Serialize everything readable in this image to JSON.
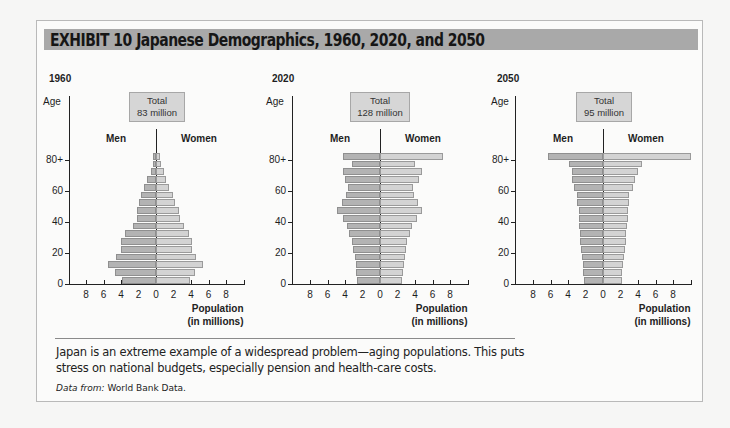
{
  "exhibit": {
    "title": "EXHIBIT 10  Japanese Demographics, 1960, 2020, and 2050",
    "caption": "Japan is an extreme example of a widespread problem—aging populations. This puts stress on national budgets, especially pension and health-care costs.",
    "source_label": "Data from:",
    "source_text": " World Bank Data."
  },
  "colors": {
    "header_bar": "#a9a9a9",
    "men_bar": "#b3b3b3",
    "women_bar": "#d3d3d3",
    "total_box": "#d6d6d6"
  },
  "chart_data": [
    {
      "type": "bar",
      "subtype": "population-pyramid",
      "title": "1960",
      "total_label": [
        "Total",
        "83 million"
      ],
      "ylabel": "Age",
      "xlabel": "Population (in millions)",
      "ytick_labels": [
        "0",
        "20",
        "40",
        "60",
        "80+"
      ],
      "xtick_labels": [
        "8",
        "6",
        "4",
        "2",
        "0",
        "2",
        "4",
        "6",
        "8"
      ],
      "xlim": [
        -10,
        10
      ],
      "legend": [
        "Men",
        "Women"
      ],
      "categories": [
        "0-4",
        "5-9",
        "10-14",
        "15-19",
        "20-24",
        "25-29",
        "30-34",
        "35-39",
        "40-44",
        "45-49",
        "50-54",
        "55-59",
        "60-64",
        "65-69",
        "70-74",
        "75-79",
        "80+"
      ],
      "series": [
        {
          "name": "Men",
          "values": [
            3.9,
            4.7,
            5.5,
            4.6,
            4.0,
            4.0,
            3.6,
            2.6,
            2.2,
            2.2,
            2.0,
            1.7,
            1.4,
            1.0,
            0.6,
            0.4,
            0.3
          ]
        },
        {
          "name": "Women",
          "values": [
            3.9,
            4.5,
            5.4,
            4.6,
            4.1,
            4.1,
            3.8,
            3.2,
            2.7,
            2.6,
            2.2,
            1.9,
            1.5,
            1.1,
            0.9,
            0.6,
            0.5
          ]
        }
      ]
    },
    {
      "type": "bar",
      "subtype": "population-pyramid",
      "title": "2020",
      "total_label": [
        "Total",
        "128 million"
      ],
      "ylabel": "Age",
      "xlabel": "Population (in millions)",
      "ytick_labels": [
        "0",
        "20",
        "40",
        "60",
        "80+"
      ],
      "xtick_labels": [
        "8",
        "6",
        "4",
        "2",
        "0",
        "2",
        "4",
        "6",
        "8"
      ],
      "xlim": [
        -10,
        10
      ],
      "legend": [
        "Men",
        "Women"
      ],
      "categories": [
        "0-4",
        "5-9",
        "10-14",
        "15-19",
        "20-24",
        "25-29",
        "30-34",
        "35-39",
        "40-44",
        "45-49",
        "50-54",
        "55-59",
        "60-64",
        "65-69",
        "70-74",
        "75-79",
        "80+"
      ],
      "series": [
        {
          "name": "Men",
          "values": [
            2.6,
            2.7,
            2.8,
            2.9,
            3.1,
            3.2,
            3.5,
            3.8,
            4.2,
            4.9,
            4.4,
            3.9,
            3.7,
            4.0,
            4.2,
            3.2,
            4.2
          ]
        },
        {
          "name": "Women",
          "values": [
            2.5,
            2.6,
            2.7,
            2.8,
            3.0,
            3.1,
            3.4,
            3.7,
            4.2,
            4.8,
            4.3,
            3.9,
            3.8,
            4.4,
            4.8,
            4.0,
            7.2
          ]
        }
      ]
    },
    {
      "type": "bar",
      "subtype": "population-pyramid",
      "title": "2050",
      "total_label": [
        "Total",
        "95 million"
      ],
      "ylabel": "Age",
      "xlabel": "Population (in millions)",
      "ytick_labels": [
        "0",
        "20",
        "40",
        "60",
        "80+"
      ],
      "xtick_labels": [
        "8",
        "6",
        "4",
        "2",
        "0",
        "2",
        "4",
        "6",
        "8"
      ],
      "xlim": [
        -10,
        10
      ],
      "legend": [
        "Men",
        "Women"
      ],
      "categories": [
        "0-4",
        "5-9",
        "10-14",
        "15-19",
        "20-24",
        "25-29",
        "30-34",
        "35-39",
        "40-44",
        "45-49",
        "50-54",
        "55-59",
        "60-64",
        "65-69",
        "70-74",
        "75-79",
        "80+"
      ],
      "series": [
        {
          "name": "Men",
          "values": [
            2.2,
            2.3,
            2.3,
            2.4,
            2.5,
            2.6,
            2.6,
            2.7,
            2.8,
            2.8,
            3.0,
            3.0,
            3.3,
            3.5,
            3.6,
            3.9,
            6.3
          ]
        },
        {
          "name": "Women",
          "values": [
            2.2,
            2.2,
            2.3,
            2.4,
            2.5,
            2.6,
            2.6,
            2.7,
            2.8,
            2.9,
            3.0,
            3.0,
            3.4,
            3.7,
            4.0,
            4.4,
            10.0
          ]
        }
      ]
    }
  ]
}
